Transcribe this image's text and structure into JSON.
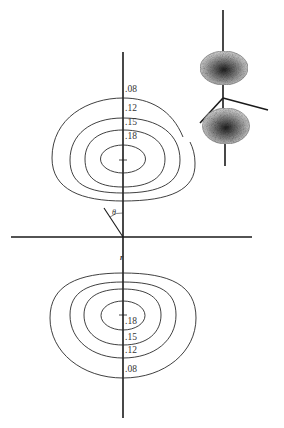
{
  "figure": {
    "type": "contour diagram of electron density (p-orbital cross-section)",
    "axes": {
      "vertical_axis": {
        "x": 123,
        "y1": 52,
        "y2": 418
      },
      "horizontal_axis": {
        "y": 237,
        "x1": 11,
        "x2": 252
      }
    },
    "angle_label": "θ",
    "radius_label": "r",
    "upper_lobe": {
      "center": [
        123,
        160
      ],
      "contours": [
        {
          "value": ".08",
          "label": ".08",
          "label_pos": [
            125,
            85
          ]
        },
        {
          "value": ".12",
          "label": ".12",
          "label_pos": [
            125,
            105
          ]
        },
        {
          "value": ".15",
          "label": ".15",
          "label_pos": [
            125,
            119
          ]
        },
        {
          "value": ".18",
          "label": ".18",
          "label_pos": [
            125,
            133
          ]
        }
      ]
    },
    "lower_lobe": {
      "center": [
        123,
        315
      ],
      "contours": [
        {
          "value": ".18",
          "label": ".18",
          "label_pos": [
            125,
            317
          ]
        },
        {
          "value": ".15",
          "label": ".15",
          "label_pos": [
            125,
            333
          ]
        },
        {
          "value": ".12",
          "label": ".12",
          "label_pos": [
            125,
            346
          ]
        },
        {
          "value": ".08",
          "label": ".08",
          "label_pos": [
            125,
            365
          ]
        }
      ]
    },
    "inset": {
      "description": "3D shaded p-orbital dumbbell with coordinate axes",
      "lobes": 2
    }
  },
  "colors": {
    "line": "#1a1a1a",
    "contour": "#2a2a2a",
    "background": "#ffffff"
  }
}
